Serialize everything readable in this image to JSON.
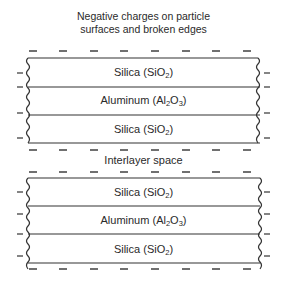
{
  "title": {
    "line1": "Negative charges on particle",
    "line2": "surfaces and broken edges"
  },
  "interlayer_label": "Interlayer space",
  "blocks": [
    {
      "layers": [
        {
          "name": "Silica",
          "formula_base": "SiO",
          "formula_sub": "2"
        },
        {
          "name": "Aluminum",
          "formula_base": "Al",
          "formula_sub": "2",
          "formula_base2": "O",
          "formula_sub2": "3"
        },
        {
          "name": "Silica",
          "formula_base": "SiO",
          "formula_sub": "2"
        }
      ]
    },
    {
      "layers": [
        {
          "name": "Silica",
          "formula_base": "SiO",
          "formula_sub": "2"
        },
        {
          "name": "Aluminum",
          "formula_base": "Al",
          "formula_sub": "2",
          "formula_base2": "O",
          "formula_sub2": "3"
        },
        {
          "name": "Silica",
          "formula_base": "SiO",
          "formula_sub": "2"
        }
      ]
    }
  ],
  "charge_symbol": "−",
  "colors": {
    "line": "#333333",
    "text": "#2a2a2a"
  }
}
